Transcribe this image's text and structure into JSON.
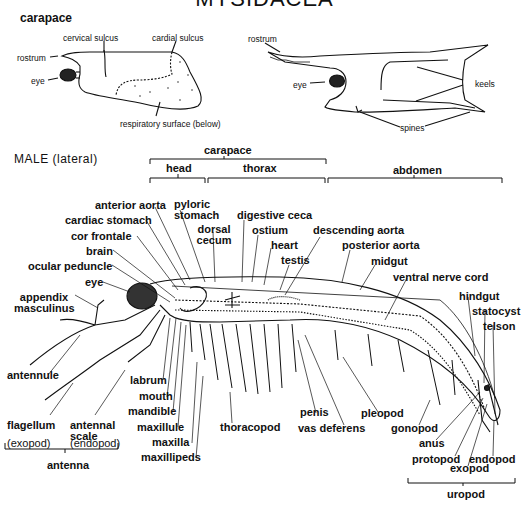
{
  "title": "MYSIDACEA",
  "carapace_section": {
    "heading": "carapace",
    "left_labels": {
      "cervical_sulcus": "cervical sulcus",
      "cardial_sulcus": "cardial sulcus",
      "rostrum": "rostrum",
      "eye": "eye",
      "respiratory_surface": "respiratory surface (below)"
    },
    "right_labels": {
      "rostrum": "rostrum",
      "eye": "eye",
      "keels": "keels",
      "spines": "spines"
    }
  },
  "male": {
    "heading": "MALE (lateral)",
    "regions": {
      "carapace": "carapace",
      "head": "head",
      "thorax": "thorax",
      "abdomen": "abdomen"
    },
    "labels": {
      "anterior_aorta": "anterior aorta",
      "pyloric_stomach_1": "pyloric",
      "pyloric_stomach_2": "stomach",
      "cardiac_stomach": "cardiac stomach",
      "dorsal_cecum_1": "dorsal",
      "dorsal_cecum_2": "cecum",
      "digestive_ceca": "digestive ceca",
      "ostium": "ostium",
      "cor_frontale": "cor frontale",
      "heart": "heart",
      "descending_aorta": "descending aorta",
      "brain": "brain",
      "testis": "testis",
      "posterior_aorta": "posterior aorta",
      "ocular_peduncle": "ocular peduncle",
      "midgut": "midgut",
      "eye": "eye",
      "ventral_nerve_cord": "ventral nerve cord",
      "appendix_masculinus_1": "appendix",
      "appendix_masculinus_2": "masculinus",
      "hindgut": "hindgut",
      "statocyst": "statocyst",
      "telson": "telson",
      "antennule": "antennule",
      "labrum": "labrum",
      "mouth": "mouth",
      "mandible": "mandible",
      "penis": "penis",
      "pleopod": "pleopod",
      "flagellum": "flagellum",
      "antennal_scale_1": "antennal",
      "antennal_scale_2": "scale",
      "maxillule": "maxillule",
      "thoracopod": "thoracopod",
      "vas_deferens": "vas deferens",
      "gonopod": "gonopod",
      "exopod_paren": "(exopod)",
      "endopod_paren": "(endopod)",
      "maxilla": "maxilla",
      "anus": "anus",
      "maxillipeds": "maxillipeds",
      "protopod": "protopod",
      "endopod": "endopod",
      "exopod": "exopod",
      "antenna": "antenna",
      "uropod": "uropod"
    }
  }
}
